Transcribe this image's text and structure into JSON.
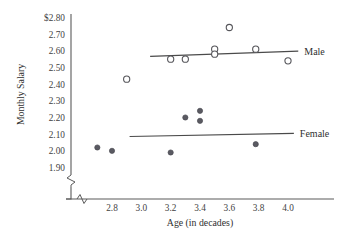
{
  "chart_data": {
    "type": "scatter",
    "title": "",
    "xlabel": "Age (in decades)",
    "ylabel": "Monthly Salary",
    "xlim": [
      2.6,
      4.1
    ],
    "ylim": [
      1.85,
      2.84
    ],
    "grid": false,
    "axis_break_x": true,
    "axis_break_y": true,
    "xticks": [
      "2.8",
      "3.0",
      "3.2",
      "3.4",
      "3.6",
      "3.8",
      "4.0"
    ],
    "xtick_values": [
      2.8,
      3.0,
      3.2,
      3.4,
      3.6,
      3.8,
      4.0
    ],
    "yticks": [
      "$2.80",
      "2.70",
      "2.60",
      "2.50",
      "2.40",
      "2.30",
      "2.20",
      "2.10",
      "2.00",
      "1.90"
    ],
    "ytick_values": [
      2.8,
      2.7,
      2.6,
      2.5,
      2.4,
      2.3,
      2.2,
      2.1,
      2.0,
      1.9
    ],
    "legend_position": "right-inline",
    "series": [
      {
        "name": "Male",
        "marker": "open-circle",
        "color": "#55555a",
        "points": [
          {
            "x": 2.9,
            "y": 2.43
          },
          {
            "x": 3.2,
            "y": 2.55
          },
          {
            "x": 3.3,
            "y": 2.55
          },
          {
            "x": 3.5,
            "y": 2.61
          },
          {
            "x": 3.5,
            "y": 2.58
          },
          {
            "x": 3.6,
            "y": 2.74
          },
          {
            "x": 3.78,
            "y": 2.61
          },
          {
            "x": 4.0,
            "y": 2.54
          }
        ],
        "trend_line": {
          "x1": 3.06,
          "y1": 2.567,
          "x2": 4.07,
          "y2": 2.598
        }
      },
      {
        "name": "Female",
        "marker": "filled-circle",
        "color": "#5a5a62",
        "points": [
          {
            "x": 2.7,
            "y": 2.02
          },
          {
            "x": 2.8,
            "y": 2.0
          },
          {
            "x": 3.2,
            "y": 1.99
          },
          {
            "x": 3.3,
            "y": 2.2
          },
          {
            "x": 3.4,
            "y": 2.24
          },
          {
            "x": 3.4,
            "y": 2.18
          },
          {
            "x": 3.78,
            "y": 2.04
          }
        ],
        "trend_line": {
          "x1": 2.92,
          "y1": 2.086,
          "x2": 4.04,
          "y2": 2.105
        }
      }
    ]
  }
}
